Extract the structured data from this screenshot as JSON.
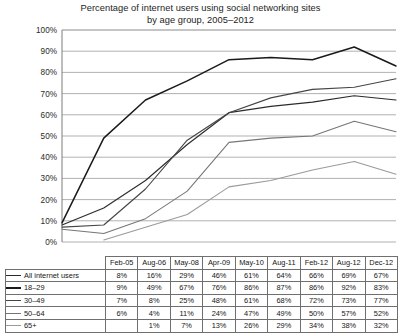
{
  "title": {
    "line1": "Percentage of internet users using social networking sites",
    "line2": "by age group, 2005–2012"
  },
  "chart_data": {
    "type": "line",
    "title": "Percentage of internet users using social networking sites by age group, 2005–2012",
    "xlabel": "",
    "ylabel": "",
    "ylim": [
      0,
      100
    ],
    "ytick_labels": [
      "100%",
      "90%",
      "80%",
      "70%",
      "60%",
      "50%",
      "40%",
      "30%",
      "20%",
      "10%",
      "0%"
    ],
    "ytick_values": [
      100,
      90,
      80,
      70,
      60,
      50,
      40,
      30,
      20,
      10,
      0
    ],
    "grid": true,
    "legend_position": "table-below",
    "categories": [
      "Feb-05",
      "Aug-06",
      "May-08",
      "Apr-09",
      "May-10",
      "Aug-11",
      "Feb-12",
      "Aug-12",
      "Dec-12"
    ],
    "series": [
      {
        "name": "All internet users",
        "color": "#2b2b2b",
        "width": 1.15,
        "values": [
          8,
          16,
          29,
          46,
          61,
          64,
          66,
          69,
          67
        ],
        "labels": [
          "8%",
          "16%",
          "29%",
          "46%",
          "61%",
          "64%",
          "66%",
          "69%",
          "67%"
        ]
      },
      {
        "name": "18–29",
        "color": "#1a1a1a",
        "width": 1.5,
        "values": [
          9,
          49,
          67,
          76,
          86,
          87,
          86,
          92,
          83
        ],
        "labels": [
          "9%",
          "49%",
          "67%",
          "76%",
          "86%",
          "87%",
          "86%",
          "92%",
          "83%"
        ]
      },
      {
        "name": "30–49",
        "color": "#454545",
        "width": 1.15,
        "values": [
          7,
          8,
          25,
          48,
          61,
          68,
          72,
          73,
          77
        ],
        "labels": [
          "7%",
          "8%",
          "25%",
          "48%",
          "61%",
          "68%",
          "72%",
          "73%",
          "77%"
        ]
      },
      {
        "name": "50–64",
        "color": "#767676",
        "width": 1.05,
        "values": [
          6,
          4,
          11,
          24,
          47,
          49,
          50,
          57,
          52
        ],
        "labels": [
          "6%",
          "4%",
          "11%",
          "24%",
          "47%",
          "49%",
          "50%",
          "57%",
          "52%"
        ]
      },
      {
        "name": "65+",
        "color": "#9a9a9a",
        "width": 1.05,
        "values": [
          null,
          1,
          7,
          13,
          26,
          29,
          34,
          38,
          32
        ],
        "labels": [
          "",
          "1%",
          "7%",
          "13%",
          "26%",
          "29%",
          "34%",
          "38%",
          "32%"
        ]
      }
    ]
  }
}
